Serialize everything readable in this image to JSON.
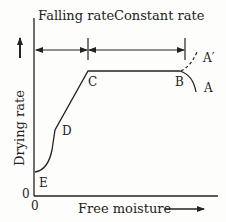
{
  "diagram": {
    "region_labels": {
      "falling": "Falling rate",
      "constant": "Constant rate"
    },
    "axes": {
      "y_label": "Drying rate",
      "x_label": "Free moisture",
      "y_origin": "0",
      "x_origin": "0"
    },
    "points": {
      "A": "A",
      "A_prime": "A′",
      "B": "B",
      "C": "C",
      "D": "D",
      "E": "E"
    },
    "colors": {
      "line": "#222222",
      "background": "#fdfdfb"
    }
  }
}
